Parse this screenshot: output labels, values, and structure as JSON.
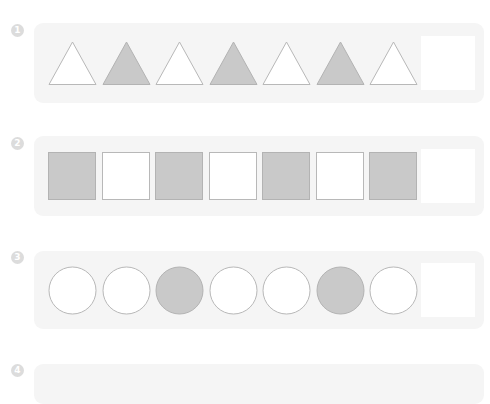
{
  "colors": {
    "panel_bg": "#f5f5f5",
    "shape_fill_gray": "#c9c9c9",
    "shape_fill_white": "#ffffff",
    "shape_stroke": "#b8b8b8",
    "badge_bg": "#dcdcdc",
    "answer_box": "#ffffff"
  },
  "problems": [
    {
      "number": "1",
      "shape": "triangle",
      "sequence": [
        "white",
        "gray",
        "white",
        "gray",
        "white",
        "gray",
        "white"
      ],
      "answer_blank": true
    },
    {
      "number": "2",
      "shape": "square",
      "sequence": [
        "gray",
        "white",
        "gray",
        "white",
        "gray",
        "white",
        "gray"
      ],
      "answer_blank": true
    },
    {
      "number": "3",
      "shape": "circle",
      "sequence": [
        "white",
        "white",
        "gray",
        "white",
        "white",
        "gray",
        "white"
      ],
      "answer_blank": true
    },
    {
      "number": "4",
      "shape": "",
      "sequence": [],
      "answer_blank": false
    }
  ]
}
